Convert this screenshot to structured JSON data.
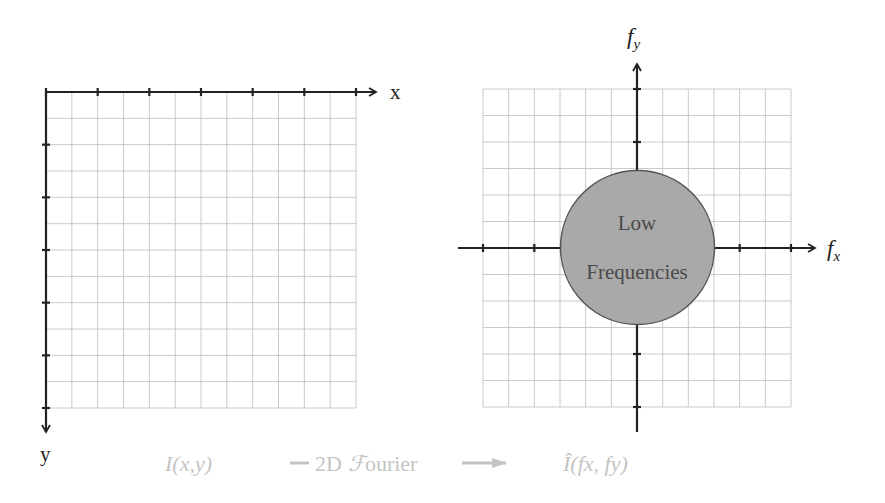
{
  "left_panel": {
    "x_axis_label": "x",
    "y_axis_label": "y",
    "grid": {
      "columns": 12,
      "rows": 12
    },
    "caption": "I(x,y)"
  },
  "right_panel": {
    "x_axis_label": "f",
    "x_axis_subscript": "x",
    "y_axis_label": "f",
    "y_axis_subscript": "y",
    "grid": {
      "columns": 12,
      "rows": 12
    },
    "circle": {
      "line1": "Low",
      "line2": "Frequencies",
      "fill": "#a9a9a9",
      "stroke": "#555555"
    },
    "caption": "Î(fx, fy)"
  },
  "transform": {
    "label_prefix": "2D",
    "label_symbol": "ℱ",
    "label_suffix": "ourier"
  },
  "colors": {
    "grid": "#bdbdbd",
    "axis": "#222222",
    "caption": "#c4c4c4"
  }
}
